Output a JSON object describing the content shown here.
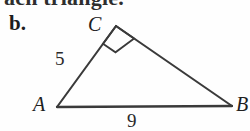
{
  "figure": {
    "clipped_header_text": "ach triangle.",
    "part_label": "b.",
    "stroke_color": "#3a3a3a",
    "background_color": "#fefefe",
    "vertices": [
      {
        "name": "C",
        "label": "C",
        "x": 116,
        "y": 26
      },
      {
        "name": "A",
        "label": "A",
        "x": 57,
        "y": 107
      },
      {
        "name": "B",
        "label": "B",
        "x": 232,
        "y": 106
      }
    ],
    "side_labels": [
      {
        "side": "AC",
        "value": "5"
      },
      {
        "side": "AB",
        "value": "9"
      }
    ],
    "right_angle": {
      "at_vertex": "C",
      "marker": "square"
    },
    "icons": {
      "right_angle_marker": "right-angle-square-icon"
    }
  }
}
